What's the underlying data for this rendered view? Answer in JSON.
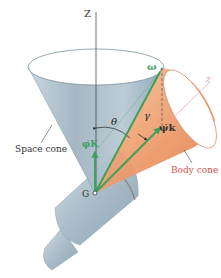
{
  "figure": {
    "axis_Z_label": "Z",
    "axis_z_label": "z",
    "omega_label": "ω",
    "theta_label": "θ",
    "gamma_label": "γ",
    "psi_k_label": "ψ̇k",
    "phi_K_label": "φ̇K",
    "G_label": "G",
    "space_cone_label": "Space cone",
    "body_cone_label": "Body cone"
  },
  "colors": {
    "space_cone": "#a9bcc8",
    "body_cone": "#e8895a",
    "vector_green": "#3aa05a",
    "label_dark": "#333333",
    "body_label": "#d8504a",
    "z_axis_pink": "#e8a0a8"
  }
}
